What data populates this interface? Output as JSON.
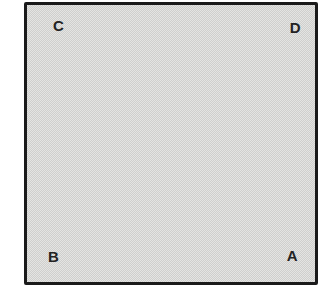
{
  "figure": {
    "background_color": "#ffffff",
    "square": {
      "fill_light": "#e4e4e2",
      "fill_dark": "#cfcfcd",
      "border_color": "#1b1b1b",
      "label_color": "#232323",
      "corner_labels": {
        "top_left": "C",
        "top_right": "D",
        "bottom_left": "B",
        "bottom_right": "A"
      }
    }
  }
}
